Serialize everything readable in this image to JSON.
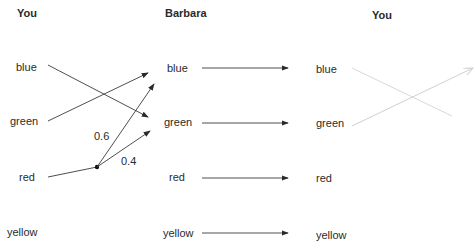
{
  "columns": [
    {
      "header": "You",
      "items": [
        "blue",
        "green",
        "red",
        "yellow"
      ]
    },
    {
      "header": "Barbara",
      "items": [
        "blue",
        "green",
        "red",
        "yellow"
      ]
    },
    {
      "header": "You",
      "items": [
        "blue",
        "green",
        "red",
        "yellow"
      ]
    }
  ],
  "probabilities": {
    "red_to_blue": "0.6",
    "red_to_green": "0.4"
  },
  "colors": {
    "line": "#3a3a3a",
    "faint_line": "#d8d8d8"
  }
}
